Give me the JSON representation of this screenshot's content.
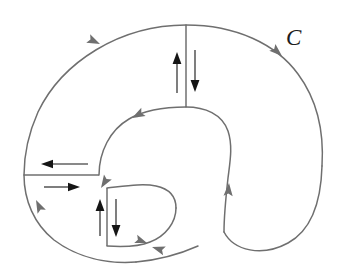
{
  "figure": {
    "title": "",
    "curve_label": "C",
    "label_position": {
      "x": 286,
      "y": 45
    },
    "canvas": {
      "width": 351,
      "height": 272
    },
    "colors": {
      "curve_stroke": "#6f6f6f",
      "arrow_stroke": "#151515",
      "label_text": "#1d1d1d",
      "background": "#ffffff"
    },
    "paths": {
      "outer_top_left_arc": "M 186 25 C 120 25 62 62 38 112 C 30 130 24 154 24 175",
      "outer_lower_left_arc": "M 24 175 C 24 200 34 224 54 240 C 78 258 108 264 136 262",
      "outer_right_arc": "M 186 25 C 236 25 276 44 298 74 C 318 101 324 134 322 166",
      "outer_right_lobe": "M 322 166 C 321 202 312 230 288 243 C 262 257 234 251 224 232",
      "inner_left_arc": "M 99 175 C 99 152 110 130 129 119 C 146 109 167 107 186 107",
      "inner_right_arc": "M 186 107 C 205 107 222 114 228 131 C 233 146 230 162 228 178 C 226 196 224 215 224 232",
      "inner_bottom_blob_upper": "M 107 188 C 125 186 143 183 156 186 C 170 189 176 197 176 208",
      "inner_bottom_blob_lower": "M 176 208 C 176 222 166 236 150 242 C 138 247 122 247 107 246",
      "outer_bottom_right_tail": "M 136 262 C 158 260 180 254 198 246"
    },
    "cuts": [
      {
        "name": "vertical-cut-upper",
        "x": 186,
        "y1": 25,
        "y2": 107
      },
      {
        "name": "horizontal-cut-left",
        "y": 175,
        "x1": 24,
        "x2": 99
      },
      {
        "name": "vertical-cut-lower",
        "x": 107,
        "y1": 188,
        "y2": 246
      }
    ],
    "flow_arrows": [
      {
        "name": "cut-arrow-up-right-upper",
        "x": 177,
        "y1": 93,
        "y2": 56,
        "direction": "up"
      },
      {
        "name": "cut-arrow-down-right-upper",
        "x": 195,
        "y1": 50,
        "y2": 88,
        "direction": "down"
      },
      {
        "name": "cut-arrow-left-horizontal",
        "y": 164,
        "x1": 88,
        "x2": 44,
        "direction": "left"
      },
      {
        "name": "cut-arrow-right-horizontal",
        "y": 187,
        "x1": 44,
        "x2": 76,
        "direction": "right"
      },
      {
        "name": "cut-arrow-up-lower",
        "x": 100,
        "y1": 236,
        "y2": 203,
        "direction": "up"
      },
      {
        "name": "cut-arrow-down-lower",
        "x": 116,
        "y1": 199,
        "y2": 233,
        "direction": "down"
      }
    ],
    "orientation_arrows": [
      {
        "name": "outer-top-left-direction",
        "x": 104,
        "y": 43,
        "angle": 205
      },
      {
        "name": "outer-right-direction",
        "x": 280,
        "y": 57,
        "angle": 228
      },
      {
        "name": "outer-lower-left-direction",
        "x": 38,
        "y": 202,
        "angle": 68
      },
      {
        "name": "inner-upper-left-direction",
        "x": 128,
        "y": 120,
        "angle": 330
      },
      {
        "name": "inner-right-descend-direction",
        "x": 228,
        "y": 180,
        "angle": 95
      },
      {
        "name": "inner-blob-left-direction",
        "x": 104,
        "y": 190,
        "angle": 300
      },
      {
        "name": "outer-bottom-direction",
        "x": 148,
        "y": 248,
        "angle": 17
      }
    ]
  }
}
